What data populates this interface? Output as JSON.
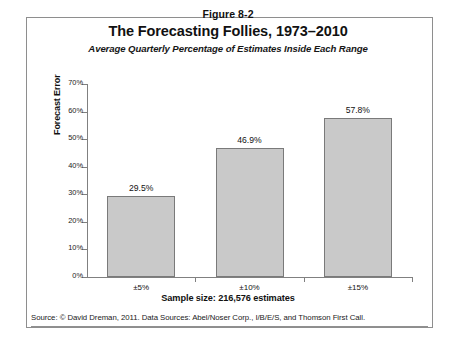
{
  "figure": {
    "number": "Figure 8-2",
    "title": "The Forecasting Follies, 1973–2010",
    "subtitle": "Average Quarterly Percentage of Estimates Inside Each Range",
    "source": "Source: © David Dreman, 2011. Data Sources: Abel/Noser Corp., I/B/E/S, and Thomson First Call.",
    "frame_color": "#8e8e8e"
  },
  "chart_data": {
    "type": "bar",
    "title": "The Forecasting Follies, 1973–2010",
    "subtitle": "Average Quarterly Percentage of Estimates Inside Each Range",
    "categories": [
      "±5%",
      "±10%",
      "±15%"
    ],
    "values": [
      29.5,
      46.9,
      57.8
    ],
    "value_labels": [
      "29.5%",
      "46.9%",
      "57.8%"
    ],
    "xlabel": "Sample size: 216,576 estimates",
    "ylabel": "Forecast Error",
    "ylim": [
      0,
      70
    ],
    "ytick_labels": [
      "0%",
      "10%",
      "20%",
      "30%",
      "40%",
      "50%",
      "60%",
      "70%"
    ],
    "ytick_values": [
      0,
      10,
      20,
      30,
      40,
      50,
      60,
      70
    ],
    "grid": false,
    "legend": false,
    "bar_fill": "#c9c9c9",
    "bar_border": "#7a7a7a",
    "axis_color": "#808080"
  }
}
